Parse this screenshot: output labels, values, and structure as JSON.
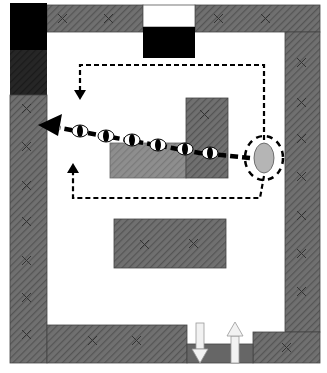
{
  "diagram": {
    "type": "floor-plan",
    "colors": {
      "background": "#ffffff",
      "wall": "#6e6e6e",
      "wall_hatch": "#5a5a5a",
      "light_block": "#8a8a8a",
      "black_block": "#000000",
      "dark_block": "#1e1e1e",
      "person": "#b5b5b5",
      "path": "#000000",
      "cross": "#3a3a3a"
    },
    "elements": {
      "walls": [
        "top-left-wall",
        "top-right-wall",
        "left-wall",
        "right-wall",
        "bottom-left-wall",
        "bottom-right-corner"
      ],
      "doors": [
        "top-door",
        "bottom-door"
      ],
      "furniture": [
        "upper-right-block",
        "lower-left-light-block",
        "center-block"
      ],
      "person": "oval-figure",
      "paths": [
        "upper-dashed-path",
        "lower-dashed-path",
        "sight-line"
      ],
      "sight_markers_count": 5,
      "bottom_arrows": [
        "down-arrow-in",
        "up-arrow-out"
      ]
    }
  }
}
